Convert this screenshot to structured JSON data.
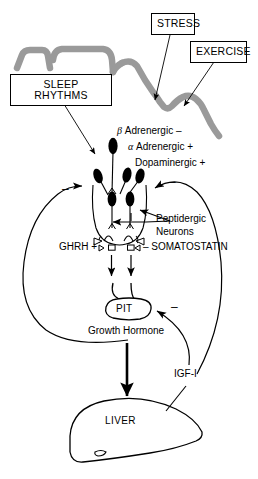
{
  "figure": {
    "background_color": "#ffffff",
    "line_color": "#000000",
    "brain_color": "#9a9a9a"
  },
  "inputs": [
    {
      "id": "sleep",
      "label": "SLEEP RHYTHMS"
    },
    {
      "id": "stress",
      "label": "STRESS"
    },
    {
      "id": "exercise",
      "label": "EXERCISE"
    }
  ],
  "neurotransmitters": [
    {
      "name": "β Adrenergic",
      "sign": "–"
    },
    {
      "name": "α Adrenergic",
      "sign": "+"
    },
    {
      "name": "Dopaminergic",
      "sign": "+"
    }
  ],
  "neuron_group": {
    "label_line1": "Peptidergic",
    "label_line2": "Neurons"
  },
  "hypothalamic_factors": {
    "releasing": {
      "label": "GHRH",
      "sign": "+"
    },
    "inhibiting": {
      "label": "SOMATOSTATIN",
      "sign": "–"
    }
  },
  "organs": [
    {
      "id": "pituitary",
      "label": "PIT"
    },
    {
      "id": "liver",
      "label": "LIVER"
    }
  ],
  "hormones": [
    {
      "id": "gh",
      "label": "Growth Hormone"
    },
    {
      "id": "igf1",
      "label": "IGF-I"
    }
  ],
  "feedback_signs": {
    "hypothalamus_left": "–",
    "hypothalamus_right": "–",
    "pituitary": "–"
  }
}
